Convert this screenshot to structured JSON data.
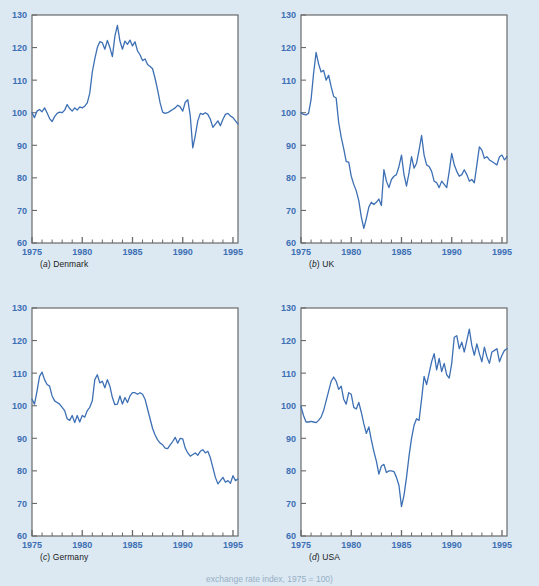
{
  "figure": {
    "background_color": "#dce9f3",
    "line_color": "#3d6fb4",
    "axis_color": "#6a6a6a",
    "tick_label_color": "#3d6fb4",
    "plot_background": "#ffffff",
    "bottom_caption": "exchange rate index, 1975 = 100)"
  },
  "axes": {
    "y_ticks": [
      60,
      70,
      80,
      90,
      100,
      110,
      120,
      130
    ],
    "y_min": 60,
    "y_max": 130,
    "x_ticks_major": [
      1975,
      1980,
      1985,
      1990,
      1995
    ],
    "x_min": 1975,
    "x_max": 1995.5,
    "x_minor_step": 1,
    "grid": false
  },
  "chart_data": [
    {
      "type": "line",
      "title": "(a) Denmark",
      "panel_letter": "a",
      "panel_name": "Denmark",
      "xlabel": "",
      "ylabel": "",
      "xlim": [
        1975,
        1995.5
      ],
      "ylim": [
        60,
        130
      ],
      "series": [
        {
          "name": "Denmark real exchange rate index",
          "x": [
            1975.0,
            1975.25,
            1975.5,
            1975.75,
            1976.0,
            1976.25,
            1976.5,
            1976.75,
            1977.0,
            1977.25,
            1977.5,
            1977.75,
            1978.0,
            1978.25,
            1978.5,
            1978.75,
            1979.0,
            1979.25,
            1979.5,
            1979.75,
            1980.0,
            1980.25,
            1980.5,
            1980.75,
            1981.0,
            1981.25,
            1981.5,
            1981.75,
            1982.0,
            1982.25,
            1982.5,
            1982.75,
            1983.0,
            1983.25,
            1983.5,
            1983.75,
            1984.0,
            1984.25,
            1984.5,
            1984.75,
            1985.0,
            1985.25,
            1985.5,
            1985.75,
            1986.0,
            1986.25,
            1986.5,
            1986.75,
            1987.0,
            1987.25,
            1987.5,
            1987.75,
            1988.0,
            1988.25,
            1988.5,
            1988.75,
            1989.0,
            1989.25,
            1989.5,
            1989.75,
            1990.0,
            1990.25,
            1990.5,
            1990.75,
            1991.0,
            1991.25,
            1991.5,
            1991.75,
            1992.0,
            1992.25,
            1992.5,
            1992.75,
            1993.0,
            1993.25,
            1993.5,
            1993.75,
            1994.0,
            1994.25,
            1994.5,
            1994.75,
            1995.0,
            1995.25,
            1995.5
          ],
          "y": [
            100.0,
            98.5,
            100.5,
            101.0,
            100.3,
            101.5,
            100.0,
            98.2,
            97.3,
            98.8,
            99.8,
            100.2,
            100.0,
            100.8,
            102.5,
            101.3,
            100.5,
            101.5,
            100.8,
            101.8,
            101.5,
            102.0,
            103.0,
            106.0,
            112.5,
            116.5,
            120.0,
            121.8,
            121.5,
            119.5,
            122.2,
            120.0,
            117.2,
            123.5,
            126.8,
            122.0,
            119.5,
            122.0,
            121.0,
            122.3,
            120.5,
            121.8,
            119.0,
            117.8,
            116.0,
            116.5,
            114.8,
            114.2,
            113.5,
            110.5,
            107.0,
            103.0,
            100.2,
            99.8,
            100.0,
            100.5,
            101.0,
            101.5,
            102.3,
            101.8,
            100.5,
            103.2,
            104.0,
            99.0,
            89.2,
            93.0,
            97.5,
            99.8,
            99.5,
            100.0,
            99.5,
            98.0,
            95.5,
            96.5,
            97.5,
            96.0,
            98.0,
            99.5,
            99.8,
            99.0,
            98.5,
            97.5,
            96.5
          ]
        }
      ]
    },
    {
      "type": "line",
      "title": "(b) UK",
      "panel_letter": "b",
      "panel_name": "UK",
      "xlabel": "",
      "ylabel": "",
      "xlim": [
        1975,
        1995.5
      ],
      "ylim": [
        60,
        130
      ],
      "series": [
        {
          "name": "UK real exchange rate index",
          "x": [
            1975.0,
            1975.25,
            1975.5,
            1975.75,
            1976.0,
            1976.25,
            1976.5,
            1976.75,
            1977.0,
            1977.25,
            1977.5,
            1977.75,
            1978.0,
            1978.25,
            1978.5,
            1978.75,
            1979.0,
            1979.25,
            1979.5,
            1979.75,
            1980.0,
            1980.25,
            1980.5,
            1980.75,
            1981.0,
            1981.25,
            1981.5,
            1981.75,
            1982.0,
            1982.25,
            1982.5,
            1982.75,
            1983.0,
            1983.25,
            1983.5,
            1983.75,
            1984.0,
            1984.25,
            1984.5,
            1984.75,
            1985.0,
            1985.25,
            1985.5,
            1985.75,
            1986.0,
            1986.25,
            1986.5,
            1986.75,
            1987.0,
            1987.25,
            1987.5,
            1987.75,
            1988.0,
            1988.25,
            1988.5,
            1988.75,
            1989.0,
            1989.25,
            1989.5,
            1989.75,
            1990.0,
            1990.25,
            1990.5,
            1990.75,
            1991.0,
            1991.25,
            1991.5,
            1991.75,
            1992.0,
            1992.25,
            1992.5,
            1992.75,
            1993.0,
            1993.25,
            1993.5,
            1993.75,
            1994.0,
            1994.25,
            1994.5,
            1994.75,
            1995.0,
            1995.25,
            1995.5
          ],
          "y": [
            100.0,
            99.5,
            99.3,
            99.8,
            104.0,
            112.0,
            118.5,
            115.0,
            112.5,
            113.0,
            110.0,
            111.5,
            108.0,
            105.0,
            104.5,
            97.0,
            92.5,
            89.0,
            85.0,
            84.8,
            80.5,
            78.0,
            76.0,
            73.0,
            68.0,
            64.5,
            67.5,
            71.0,
            72.5,
            71.8,
            72.5,
            73.5,
            71.5,
            82.5,
            79.0,
            77.0,
            79.5,
            80.5,
            81.0,
            83.5,
            87.0,
            81.0,
            77.5,
            81.5,
            86.5,
            83.0,
            84.5,
            88.5,
            93.0,
            87.0,
            84.0,
            83.5,
            82.0,
            79.0,
            78.5,
            77.0,
            79.0,
            78.0,
            77.0,
            82.0,
            87.5,
            84.0,
            82.0,
            80.5,
            81.0,
            82.5,
            81.0,
            79.0,
            79.5,
            78.5,
            84.0,
            89.5,
            88.5,
            86.0,
            86.5,
            85.5,
            85.0,
            84.5,
            84.0,
            86.5,
            87.0,
            85.5,
            86.5
          ]
        }
      ]
    },
    {
      "type": "line",
      "title": "(c) Germany",
      "panel_letter": "c",
      "panel_name": "Germany",
      "xlabel": "",
      "ylabel": "",
      "xlim": [
        1975,
        1995.5
      ],
      "ylim": [
        60,
        130
      ],
      "series": [
        {
          "name": "Germany real exchange rate index",
          "x": [
            1975.0,
            1975.25,
            1975.5,
            1975.75,
            1976.0,
            1976.25,
            1976.5,
            1976.75,
            1977.0,
            1977.25,
            1977.5,
            1977.75,
            1978.0,
            1978.25,
            1978.5,
            1978.75,
            1979.0,
            1979.25,
            1979.5,
            1979.75,
            1980.0,
            1980.25,
            1980.5,
            1980.75,
            1981.0,
            1981.25,
            1981.5,
            1981.75,
            1982.0,
            1982.25,
            1982.5,
            1982.75,
            1983.0,
            1983.25,
            1983.5,
            1983.75,
            1984.0,
            1984.25,
            1984.5,
            1984.75,
            1985.0,
            1985.25,
            1985.5,
            1985.75,
            1986.0,
            1986.25,
            1986.5,
            1986.75,
            1987.0,
            1987.25,
            1987.5,
            1987.75,
            1988.0,
            1988.25,
            1988.5,
            1988.75,
            1989.0,
            1989.25,
            1989.5,
            1989.75,
            1990.0,
            1990.25,
            1990.5,
            1990.75,
            1991.0,
            1991.25,
            1991.5,
            1991.75,
            1992.0,
            1992.25,
            1992.5,
            1992.75,
            1993.0,
            1993.25,
            1993.5,
            1993.75,
            1994.0,
            1994.25,
            1994.5,
            1994.75,
            1995.0,
            1995.25,
            1995.5
          ],
          "y": [
            102.0,
            100.5,
            104.5,
            109.0,
            110.3,
            108.0,
            106.5,
            106.0,
            103.0,
            101.5,
            101.0,
            100.5,
            99.5,
            98.5,
            96.0,
            95.5,
            97.0,
            94.8,
            97.0,
            95.0,
            97.0,
            96.5,
            98.5,
            99.5,
            101.5,
            108.0,
            109.5,
            107.0,
            107.5,
            105.5,
            108.0,
            106.0,
            102.5,
            100.3,
            100.5,
            103.0,
            100.5,
            102.5,
            101.0,
            103.0,
            104.0,
            104.0,
            103.5,
            104.0,
            103.5,
            102.0,
            99.0,
            96.0,
            93.0,
            91.0,
            89.5,
            88.5,
            88.0,
            87.0,
            86.8,
            88.0,
            89.0,
            90.3,
            88.5,
            90.0,
            89.8,
            87.0,
            85.5,
            84.5,
            85.0,
            85.5,
            84.8,
            86.0,
            86.5,
            85.5,
            86.0,
            84.0,
            81.0,
            78.0,
            76.0,
            77.0,
            78.0,
            76.5,
            77.0,
            76.2,
            78.5,
            77.0,
            77.5
          ]
        }
      ]
    },
    {
      "type": "line",
      "title": "(d) USA",
      "panel_letter": "d",
      "panel_name": "USA",
      "xlabel": "",
      "ylabel": "",
      "xlim": [
        1975,
        1995.5
      ],
      "ylim": [
        60,
        130
      ],
      "series": [
        {
          "name": "USA real exchange rate index",
          "x": [
            1975.0,
            1975.25,
            1975.5,
            1975.75,
            1976.0,
            1976.25,
            1976.5,
            1976.75,
            1977.0,
            1977.25,
            1977.5,
            1977.75,
            1978.0,
            1978.25,
            1978.5,
            1978.75,
            1979.0,
            1979.25,
            1979.5,
            1979.75,
            1980.0,
            1980.25,
            1980.5,
            1980.75,
            1981.0,
            1981.25,
            1981.5,
            1981.75,
            1982.0,
            1982.25,
            1982.5,
            1982.75,
            1983.0,
            1983.25,
            1983.5,
            1983.75,
            1984.0,
            1984.25,
            1984.5,
            1984.75,
            1985.0,
            1985.25,
            1985.5,
            1985.75,
            1986.0,
            1986.25,
            1986.5,
            1986.75,
            1987.0,
            1987.25,
            1987.5,
            1987.75,
            1988.0,
            1988.25,
            1988.5,
            1988.75,
            1989.0,
            1989.25,
            1989.5,
            1989.75,
            1990.0,
            1990.25,
            1990.5,
            1990.75,
            1991.0,
            1991.25,
            1991.5,
            1991.75,
            1992.0,
            1992.25,
            1992.5,
            1992.75,
            1993.0,
            1993.25,
            1993.5,
            1993.75,
            1994.0,
            1994.25,
            1994.5,
            1994.75,
            1995.0,
            1995.25,
            1995.5
          ],
          "y": [
            99.8,
            97.0,
            95.0,
            95.0,
            95.2,
            95.0,
            94.8,
            95.5,
            96.5,
            98.5,
            101.5,
            104.5,
            107.5,
            108.8,
            107.5,
            105.0,
            106.0,
            102.0,
            100.5,
            104.0,
            103.5,
            99.5,
            99.0,
            101.0,
            98.0,
            94.5,
            91.5,
            93.5,
            89.5,
            86.0,
            83.0,
            79.0,
            81.5,
            82.0,
            79.5,
            80.0,
            80.0,
            79.8,
            78.0,
            75.5,
            69.0,
            72.5,
            78.0,
            84.5,
            90.0,
            94.0,
            96.0,
            95.5,
            102.0,
            109.0,
            106.5,
            110.0,
            113.5,
            116.0,
            111.0,
            114.5,
            110.5,
            113.0,
            109.5,
            108.5,
            113.0,
            121.0,
            121.5,
            117.5,
            119.5,
            116.5,
            120.0,
            123.5,
            118.5,
            115.5,
            119.0,
            116.0,
            113.5,
            118.0,
            115.0,
            113.0,
            116.5,
            117.0,
            117.5,
            113.5,
            115.5,
            117.0,
            117.5
          ]
        }
      ]
    }
  ]
}
